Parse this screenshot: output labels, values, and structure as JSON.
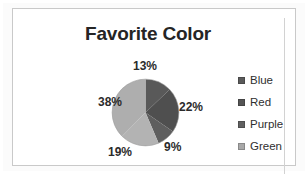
{
  "chart_data": {
    "type": "pie",
    "title": "Favorite Color",
    "categories": [
      "Blue",
      "Red",
      "Purple",
      "Green",
      "Other"
    ],
    "values": [
      13,
      22,
      9,
      19,
      38
    ],
    "data_labels": [
      "13%",
      "22%",
      "9%",
      "19%",
      "38%"
    ],
    "slice_colors": [
      "#595959",
      "#4f4f4f",
      "#5e5e5e",
      "#b3b3b3",
      "#aeaeae"
    ],
    "legend_position": "right",
    "grid": false,
    "xlabel": "",
    "ylabel": ""
  },
  "chart": {
    "title": "Favorite Color",
    "labels": [
      {
        "text": "13%"
      },
      {
        "text": "22%"
      },
      {
        "text": "9%"
      },
      {
        "text": "19%"
      },
      {
        "text": "38%"
      }
    ]
  },
  "legend": {
    "items": [
      {
        "label": "Blue",
        "swatch": "#5a5a5a"
      },
      {
        "label": "Red",
        "swatch": "#545454"
      },
      {
        "label": "Purple",
        "swatch": "#606060"
      },
      {
        "label": "Green",
        "swatch": "#a8a8a8"
      }
    ]
  },
  "colors": {
    "title_text": "#252525",
    "label_text": "#2b2b2b",
    "frame_border": "#c9c9c9",
    "plot_background": "#ffffff",
    "page_background": "#fbfbfb"
  }
}
